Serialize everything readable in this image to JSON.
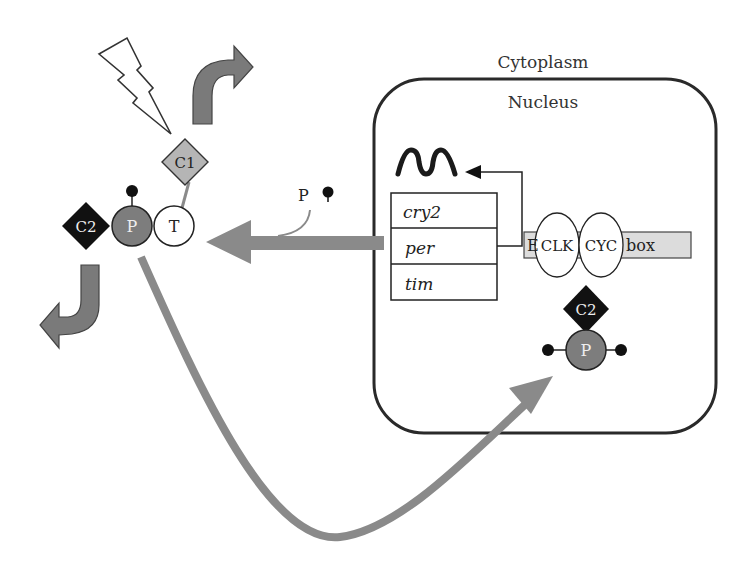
{
  "diagram": {
    "type": "circadian clock feedback loop",
    "compartments": {
      "outer": "Cytoplasm",
      "inner": "Nucleus"
    },
    "genes": [
      "cry2",
      "per",
      "tim"
    ],
    "promoter": {
      "left_label": "E",
      "right_label": "box",
      "bound_proteins": [
        "CLK",
        "CYC"
      ]
    },
    "cytoplasm_complex": {
      "c2_label": "C2",
      "p_label": "P",
      "t_label": "T",
      "c1_label": "C1"
    },
    "nuclear_complex": {
      "c2_label": "C2",
      "p_label": "P"
    },
    "phosphate_label": "P",
    "icons": {
      "lightning": "light-stimulus-icon",
      "transcript": "mrna-wave-icon"
    },
    "colors": {
      "arrow_gray": "#8a8a8a",
      "p_circle": "#7d7d7d",
      "c1_diamond": "#b5b5b5",
      "c2_diamond": "#111111",
      "ebox_fill": "#dcdcdc",
      "outline": "#222222"
    }
  }
}
